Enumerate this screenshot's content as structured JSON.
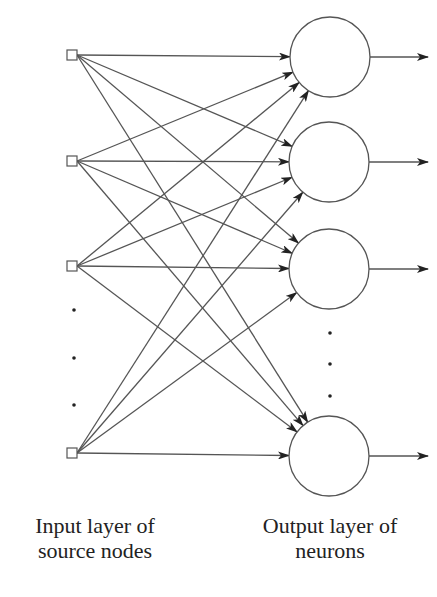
{
  "diagram": {
    "type": "single-layer feedforward network",
    "stroke_color": "#555555",
    "inputs": [
      {
        "x": 72,
        "y": 55
      },
      {
        "x": 72,
        "y": 161
      },
      {
        "x": 72,
        "y": 266
      },
      {
        "x": 72,
        "y": 453
      }
    ],
    "input_ellipsis_dots": [
      {
        "x": 74,
        "y": 310
      },
      {
        "x": 74,
        "y": 358
      },
      {
        "x": 74,
        "y": 405
      }
    ],
    "outputs": [
      {
        "x": 330,
        "y": 57
      },
      {
        "x": 329,
        "y": 162
      },
      {
        "x": 329,
        "y": 269
      },
      {
        "x": 329,
        "y": 456
      }
    ],
    "output_radius": 40,
    "output_ellipsis_dots": [
      {
        "x": 330,
        "y": 333
      },
      {
        "x": 330,
        "y": 364
      },
      {
        "x": 330,
        "y": 396
      }
    ],
    "output_arrow_end_x": 428
  },
  "labels": {
    "input_line1": "Input layer of",
    "input_line2": "source nodes",
    "output_line1": "Output layer of",
    "output_line2": "neurons"
  }
}
